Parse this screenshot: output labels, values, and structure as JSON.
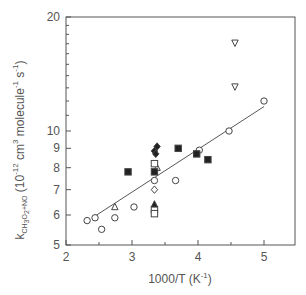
{
  "chart_data": {
    "type": "scatter",
    "title": "",
    "xlabel": "1000/T (K^-1)",
    "ylabel": "k_CH3O2+NO (10^-12 cm^3 molecule^-1 s^-1)",
    "xlim": [
      2,
      5.45
    ],
    "ylim": [
      5,
      20
    ],
    "yscale": "log",
    "grid": false,
    "legend": null,
    "x_ticks": [
      2,
      3,
      4,
      5
    ],
    "x_minor_ticks": [
      2.5,
      3.5,
      4.5
    ],
    "y_ticks": [
      5,
      6,
      7,
      8,
      9,
      10,
      20
    ],
    "series": [
      {
        "name": "open-circle",
        "marker": "circle-open",
        "points": [
          [
            2.32,
            5.8
          ],
          [
            2.44,
            5.9
          ],
          [
            2.54,
            5.5
          ],
          [
            2.74,
            5.9
          ],
          [
            3.03,
            6.3
          ],
          [
            3.34,
            7.4
          ],
          [
            3.66,
            7.4
          ],
          [
            4.02,
            8.9
          ],
          [
            4.47,
            10.0
          ],
          [
            5.0,
            12.0
          ]
        ]
      },
      {
        "name": "open-triangle-up",
        "marker": "triangle-up-open",
        "points": [
          [
            2.74,
            6.3
          ],
          [
            3.38,
            8.0
          ]
        ]
      },
      {
        "name": "open-triangle-down",
        "marker": "triangle-down-open",
        "points": [
          [
            4.56,
            17.1
          ],
          [
            4.56,
            13.1
          ]
        ]
      },
      {
        "name": "filled-square",
        "marker": "square-filled",
        "points": [
          [
            2.94,
            7.8
          ],
          [
            3.34,
            7.8
          ],
          [
            3.7,
            9.0
          ],
          [
            3.98,
            8.7
          ],
          [
            4.15,
            8.4
          ]
        ]
      },
      {
        "name": "open-square",
        "marker": "square-open",
        "points": [
          [
            3.34,
            8.2
          ],
          [
            3.34,
            6.2
          ],
          [
            3.34,
            6.05
          ]
        ]
      },
      {
        "name": "filled-diamond",
        "marker": "diamond-filled",
        "points": [
          [
            3.38,
            9.1
          ],
          [
            3.34,
            8.85
          ],
          [
            3.36,
            8.7
          ]
        ]
      },
      {
        "name": "open-diamond",
        "marker": "diamond-open",
        "points": [
          [
            3.34,
            7.0
          ]
        ]
      },
      {
        "name": "filled-triangle-up",
        "marker": "triangle-up-filled",
        "points": [
          [
            3.34,
            6.4
          ]
        ]
      }
    ],
    "fit_line": {
      "x": [
        2.4,
        5.0
      ],
      "y": [
        5.9,
        11.6
      ]
    }
  },
  "axes": {
    "x_title": "1000/T (K",
    "x_title_sup": "-1",
    "x_title_end": ")",
    "y_title_k": "k",
    "y_title_sub": "CH3O2+NO",
    "y_title_rest": "(10",
    "y_title_exp": "-12",
    "y_title_units": "cm",
    "y_title_cm_exp": "3",
    "y_title_molecule": "molecule",
    "y_title_mol_exp": "-1",
    "y_title_s": "s",
    "y_title_s_exp": "-1",
    "y_title_close": ")"
  }
}
